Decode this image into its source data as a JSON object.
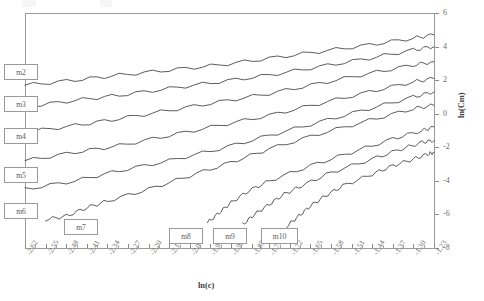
{
  "chart_data": {
    "type": "line",
    "title": "",
    "xlabel": "ln(c)",
    "ylabel": "ln(Cm)",
    "xlim": [
      -2.62,
      -1.23
    ],
    "ylim": [
      -8,
      6
    ],
    "grid": false,
    "legend_position": "inline-boxes",
    "x_ticks": [
      "-2.62",
      "-2.55",
      "-2.48",
      "-2.41",
      "-2.34",
      "-2.27",
      "-2.20",
      "-2.13",
      "-2.06",
      "-1.99",
      "-1.92",
      "-1.85",
      "-1.79",
      "-1.72",
      "-1.65",
      "-1.58",
      "-1.51",
      "-1.44",
      "-1.37",
      "-1.30",
      "-1.23"
    ],
    "y_ticks": [
      "6",
      "4",
      "2",
      "0",
      "-2",
      "-4",
      "-6",
      "-8"
    ],
    "series": [
      {
        "name": "m2",
        "label_side": "left",
        "points": [
          [
            -2.62,
            1.7
          ],
          [
            -2.45,
            2.0
          ],
          [
            -2.3,
            2.3
          ],
          [
            -2.13,
            2.6
          ],
          [
            -1.96,
            2.9
          ],
          [
            -1.79,
            3.3
          ],
          [
            -1.62,
            3.7
          ],
          [
            -1.45,
            4.1
          ],
          [
            -1.3,
            4.5
          ],
          [
            -1.23,
            4.7
          ]
        ]
      },
      {
        "name": "m3",
        "label_side": "left",
        "points": [
          [
            -2.62,
            0.4
          ],
          [
            -2.45,
            0.8
          ],
          [
            -2.3,
            1.1
          ],
          [
            -2.13,
            1.5
          ],
          [
            -1.96,
            1.9
          ],
          [
            -1.79,
            2.3
          ],
          [
            -1.62,
            2.8
          ],
          [
            -1.45,
            3.3
          ],
          [
            -1.3,
            3.8
          ],
          [
            -1.23,
            4.0
          ]
        ]
      },
      {
        "name": "m4",
        "label_side": "left",
        "points": [
          [
            -2.62,
            -1.1
          ],
          [
            -2.45,
            -0.7
          ],
          [
            -2.3,
            -0.3
          ],
          [
            -2.13,
            0.2
          ],
          [
            -1.96,
            0.7
          ],
          [
            -1.79,
            1.2
          ],
          [
            -1.62,
            1.8
          ],
          [
            -1.45,
            2.4
          ],
          [
            -1.3,
            2.9
          ],
          [
            -1.23,
            3.1
          ]
        ]
      },
      {
        "name": "m5",
        "label_side": "left",
        "points": [
          [
            -2.62,
            -2.8
          ],
          [
            -2.45,
            -2.3
          ],
          [
            -2.3,
            -1.9
          ],
          [
            -2.13,
            -1.3
          ],
          [
            -1.96,
            -0.7
          ],
          [
            -1.79,
            -0.1
          ],
          [
            -1.62,
            0.6
          ],
          [
            -1.45,
            1.3
          ],
          [
            -1.3,
            1.9
          ],
          [
            -1.23,
            2.1
          ]
        ]
      },
      {
        "name": "m6",
        "label_side": "left",
        "points": [
          [
            -2.62,
            -4.5
          ],
          [
            -2.45,
            -4.0
          ],
          [
            -2.3,
            -3.4
          ],
          [
            -2.13,
            -2.8
          ],
          [
            -1.96,
            -2.1
          ],
          [
            -1.79,
            -1.3
          ],
          [
            -1.62,
            -0.5
          ],
          [
            -1.45,
            0.3
          ],
          [
            -1.3,
            1.0
          ],
          [
            -1.23,
            1.3
          ]
        ]
      },
      {
        "name": "m7",
        "label_side": "bottom",
        "points": [
          [
            -2.55,
            -6.3
          ],
          [
            -2.48,
            -6.1
          ],
          [
            -2.41,
            -5.6
          ],
          [
            -2.34,
            -5.2
          ],
          [
            -2.2,
            -4.5
          ],
          [
            -2.06,
            -3.7
          ],
          [
            -1.92,
            -2.9
          ],
          [
            -1.79,
            -2.1
          ],
          [
            -1.62,
            -1.2
          ],
          [
            -1.45,
            -0.4
          ],
          [
            -1.3,
            0.3
          ],
          [
            -1.23,
            0.5
          ]
        ]
      },
      {
        "name": "m8",
        "label_side": "bottom",
        "points": [
          [
            -2.0,
            -6.5
          ],
          [
            -1.96,
            -5.9
          ],
          [
            -1.92,
            -5.3
          ],
          [
            -1.86,
            -4.6
          ],
          [
            -1.79,
            -4.0
          ],
          [
            -1.65,
            -3.1
          ],
          [
            -1.51,
            -2.3
          ],
          [
            -1.37,
            -1.5
          ],
          [
            -1.27,
            -1.0
          ],
          [
            -1.23,
            -0.8
          ]
        ]
      },
      {
        "name": "m9",
        "label_side": "bottom",
        "points": [
          [
            -1.88,
            -6.6
          ],
          [
            -1.84,
            -6.0
          ],
          [
            -1.79,
            -5.4
          ],
          [
            -1.74,
            -4.8
          ],
          [
            -1.68,
            -4.3
          ],
          [
            -1.58,
            -3.5
          ],
          [
            -1.44,
            -2.7
          ],
          [
            -1.34,
            -2.1
          ],
          [
            -1.27,
            -1.7
          ],
          [
            -1.23,
            -1.6
          ]
        ]
      },
      {
        "name": "m10",
        "label_side": "bottom",
        "points": [
          [
            -1.73,
            -6.7
          ],
          [
            -1.69,
            -6.1
          ],
          [
            -1.65,
            -5.5
          ],
          [
            -1.6,
            -4.9
          ],
          [
            -1.54,
            -4.3
          ],
          [
            -1.44,
            -3.6
          ],
          [
            -1.37,
            -3.1
          ],
          [
            -1.3,
            -2.7
          ],
          [
            -1.25,
            -2.4
          ],
          [
            -1.23,
            -2.3
          ]
        ]
      }
    ]
  },
  "series_labels": {
    "m2": "m2",
    "m3": "m3",
    "m4": "m4",
    "m5": "m5",
    "m6": "m6",
    "m7": "m7",
    "m8": "m8",
    "m9": "m9",
    "m10": "m10"
  }
}
